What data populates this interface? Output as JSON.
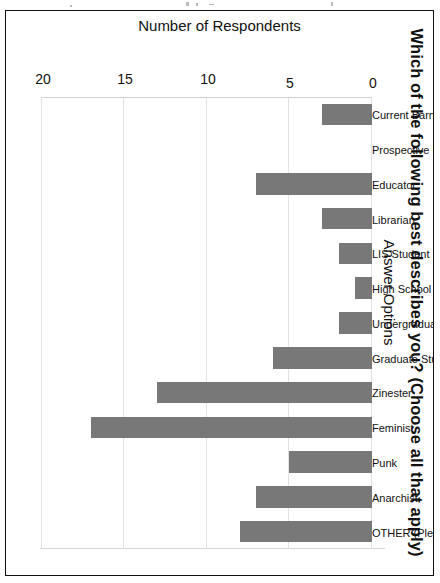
{
  "chart_data": {
    "type": "bar",
    "title": "Which of the following best describes you? (Choose all that apply)",
    "xlabel": "Answer Options",
    "ylabel": "Number of Respondents",
    "ylim": [
      0,
      20
    ],
    "yticks": [
      "0",
      "5",
      "10",
      "15",
      "20"
    ],
    "grid": true,
    "legend": "none",
    "orientation": "vertical-bars-page-rotated-90cw",
    "bar_color": "#787878",
    "categories": [
      "Current Barnard/Columbia community member",
      "Prospective Barnard/Columbia community member",
      "Educator",
      "Librarian",
      "LIS Student",
      "High School Student",
      "Undergraduate Student",
      "Graduate Student",
      "Zinester",
      "Feminist",
      "Punk",
      "Anarchist",
      "OTHER (Please Specify):"
    ],
    "values": [
      3,
      0,
      7,
      3,
      2,
      1,
      2,
      6,
      13,
      17,
      5,
      7,
      8
    ]
  },
  "page": {
    "top_fleck_count": 5
  }
}
